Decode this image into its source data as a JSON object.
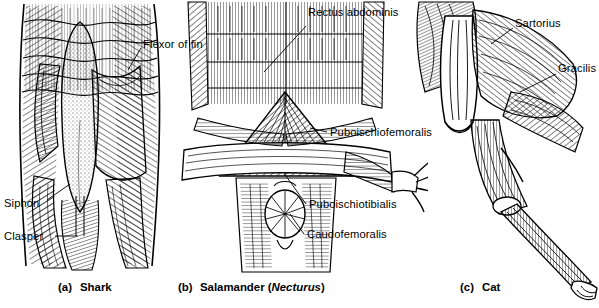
{
  "figure": {
    "background": "#ffffff",
    "ink": "#000000"
  },
  "panels": [
    {
      "id": "shark",
      "caption_tag": "(a)",
      "caption_name": "Shark",
      "labels": [
        {
          "key": "flexor",
          "text": "Flexor of fin"
        },
        {
          "key": "siphon",
          "text": "Siphon"
        },
        {
          "key": "clasper",
          "text": "Clasper"
        }
      ]
    },
    {
      "id": "salamander",
      "caption_tag": "(b)",
      "caption_name": "Salamander (",
      "caption_genus": "Necturus",
      "caption_close": ")",
      "labels": [
        {
          "key": "rectus",
          "text": "Rectus abdominis"
        },
        {
          "key": "puboischiofemoralis",
          "text": "Puboischiofemoralis"
        },
        {
          "key": "puboischiotibialis",
          "text": "Puboischiotibialis"
        },
        {
          "key": "caudofemoralis",
          "text": "Caudofemoralis"
        }
      ]
    },
    {
      "id": "cat",
      "caption_tag": "(c)",
      "caption_name": "Cat",
      "labels": [
        {
          "key": "sartorius",
          "text": "Sartorius"
        },
        {
          "key": "gracilis",
          "text": "Gracilis"
        }
      ]
    }
  ]
}
